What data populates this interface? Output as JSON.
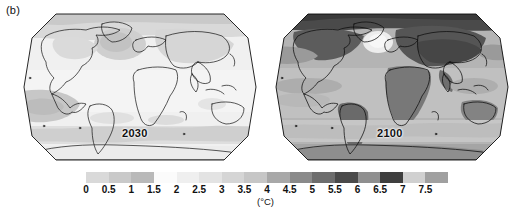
{
  "figure": {
    "panel_label": "(b)",
    "units_label": "(°C)"
  },
  "maps": [
    {
      "name": "map-2030",
      "year_label": "2030",
      "projection": "robinson",
      "description": "Projected surface air temperature change for 2030"
    },
    {
      "name": "map-2100",
      "year_label": "2100",
      "projection": "robinson",
      "description": "Projected surface air temperature change for 2100"
    }
  ],
  "chart_data": {
    "type": "heatmap",
    "title": "",
    "subtitle": "",
    "xlabel": "",
    "ylabel": "",
    "units": "°C",
    "colorbar_label": "(°C)",
    "colorbar_orientation": "horizontal",
    "legend_position": "bottom",
    "grid": false,
    "panels": [
      {
        "label": "2030",
        "projection": "robinson",
        "typical_value_range": [
          0.5,
          2.0
        ],
        "regions": [
          {
            "name": "Arctic",
            "value": 2.0
          },
          {
            "name": "North America",
            "value": 1.0
          },
          {
            "name": "Greenland / North Atlantic",
            "value": 1.5
          },
          {
            "name": "Eurasia",
            "value": 1.5
          },
          {
            "name": "Africa",
            "value": 1.0
          },
          {
            "name": "South America",
            "value": 1.0
          },
          {
            "name": "Australia",
            "value": 1.0
          },
          {
            "name": "Antarctica",
            "value": 0.5
          },
          {
            "name": "Southern Ocean",
            "value": 1.5
          },
          {
            "name": "Tropical Pacific",
            "value": 0.5
          }
        ]
      },
      {
        "label": "2100",
        "projection": "robinson",
        "typical_value_range": [
          2.0,
          7.5
        ],
        "regions": [
          {
            "name": "Arctic",
            "value": 7.5
          },
          {
            "name": "North America",
            "value": 5.5
          },
          {
            "name": "North Atlantic cold spot",
            "value": 1.0
          },
          {
            "name": "Eurasia",
            "value": 6.0
          },
          {
            "name": "Africa",
            "value": 4.5
          },
          {
            "name": "South America",
            "value": 4.5
          },
          {
            "name": "Australia",
            "value": 4.0
          },
          {
            "name": "Antarctica",
            "value": 3.0
          },
          {
            "name": "Southern Ocean",
            "value": 2.5
          },
          {
            "name": "Tropical Pacific",
            "value": 3.0
          }
        ]
      }
    ],
    "colorbar": {
      "ticks": [
        "0",
        "0.5",
        "1",
        "1.5",
        "2",
        "2.5",
        "3",
        "3.5",
        "4",
        "4.5",
        "5",
        "5.5",
        "6",
        "6.5",
        "7",
        "7.5"
      ],
      "tick_values": [
        0,
        0.5,
        1,
        1.5,
        2,
        2.5,
        3,
        3.5,
        4,
        4.5,
        5,
        5.5,
        6,
        6.5,
        7,
        7.5
      ],
      "vmin": 0,
      "vmax": 8,
      "step": 0.5,
      "colors": [
        "#d9d9d9",
        "#c9c9c9",
        "#b9b9b9",
        "#fbfbfb",
        "#efefef",
        "#e3e3e3",
        "#d5d5d5",
        "#c6c6c6",
        "#a8a8a8",
        "#8a8a8a",
        "#6d6d6d",
        "#4a4a4a",
        "#8f8f8f",
        "#3f3f3f",
        "#d0d0d0",
        "#a0a0a0"
      ]
    }
  }
}
